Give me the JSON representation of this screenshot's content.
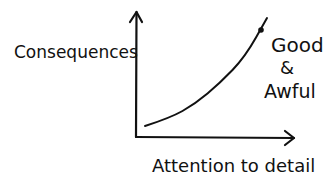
{
  "chart_data": {
    "type": "line",
    "title": "",
    "xlabel": "Attention to detail",
    "ylabel": "Consequences",
    "style": "hand-drawn sketch, no ticks, no grid",
    "series": [
      {
        "name": "Consequences vs attention",
        "points_px": [
          [
            145,
            126
          ],
          [
            170,
            118
          ],
          [
            195,
            104
          ],
          [
            220,
            83
          ],
          [
            245,
            57
          ],
          [
            267,
            18
          ]
        ],
        "annotation": {
          "point_px": [
            261,
            30
          ],
          "label_lines": [
            "Good",
            "&",
            "Awful"
          ]
        }
      }
    ],
    "grid": false,
    "legend": null
  },
  "colors": {
    "ink": "#111111",
    "background": "#ffffff"
  }
}
